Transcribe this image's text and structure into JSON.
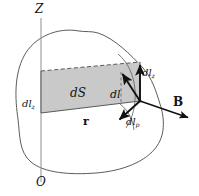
{
  "figure": {
    "background_color": "#ffffff",
    "line_color": "#3a3a3a",
    "vector_color": "#111111",
    "shade_fill": "#c9c9c9",
    "shade_stroke": "#6b6b6b",
    "axis_color": "#8a8a8a"
  },
  "labels": {
    "z_axis": "Z",
    "origin": "O",
    "area_element": "dS",
    "line_element": "dl",
    "line_element_z_left": "dl",
    "line_element_z_left_sub": "z",
    "line_element_z_right": "dl",
    "line_element_z_right_sub": "z",
    "line_element_rho": "dl",
    "line_element_rho_sub": "p",
    "position_vector": "r",
    "magnetic_field": "B"
  },
  "geometry": {
    "z_axis": {
      "x": 41,
      "y_top": 18,
      "y_bottom": 182
    },
    "vertex_point": {
      "x": 140,
      "y": 101
    },
    "vectors": [
      {
        "name": "dl",
        "from": [
          140,
          101
        ],
        "to": [
          121,
          72
        ]
      },
      {
        "name": "dl_z",
        "from": [
          140,
          101
        ],
        "to": [
          140,
          62
        ]
      },
      {
        "name": "dl_rho",
        "from": [
          140,
          101
        ],
        "to": [
          117,
          122
        ]
      },
      {
        "name": "B",
        "from": [
          140,
          101
        ],
        "to": [
          191,
          119
        ]
      }
    ],
    "parallelogram": {
      "points": [
        [
          41,
          71
        ],
        [
          140,
          62
        ],
        [
          140,
          101
        ],
        [
          41,
          113
        ]
      ],
      "dashed_edges": [
        "top",
        "right"
      ],
      "solid_edges": [
        "bottom",
        "left"
      ]
    }
  }
}
